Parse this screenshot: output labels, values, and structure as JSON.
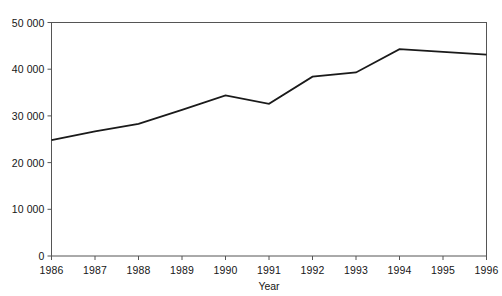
{
  "chart_data": {
    "type": "line",
    "title": "",
    "subtitle": "",
    "xlabel": "Year",
    "ylabel": "",
    "x": [
      1986,
      1987,
      1988,
      1989,
      1990,
      1991,
      1992,
      1993,
      1994,
      1995,
      1996
    ],
    "xtick_labels": [
      "1986",
      "1987",
      "1988",
      "1989",
      "1990",
      "1991",
      "1992",
      "1993",
      "1994",
      "1995",
      "1996"
    ],
    "ytick_values": [
      0,
      10000,
      20000,
      30000,
      40000,
      50000
    ],
    "ytick_labels": [
      "0",
      "10 000",
      "20 000",
      "30 000",
      "40 000",
      "50 000"
    ],
    "xlim": [
      1986,
      1996
    ],
    "ylim": [
      0,
      50000
    ],
    "grid": false,
    "legend": false,
    "legend_position": "none",
    "annotations": [],
    "series": [
      {
        "name": "",
        "color": "#1a1a1a",
        "line_width": 1.8,
        "markers": false,
        "values": [
          24800,
          26700,
          28300,
          31300,
          34400,
          32600,
          38400,
          39300,
          44300,
          43700,
          43100
        ]
      }
    ]
  },
  "axes": {
    "frame_color": "#555555",
    "tick_color": "#555555",
    "background": "#ffffff"
  }
}
